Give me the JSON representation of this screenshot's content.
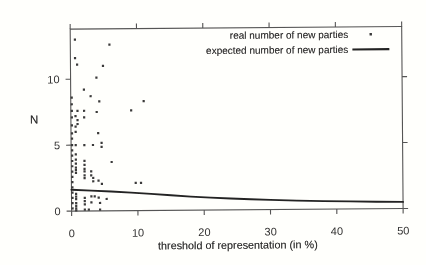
{
  "figure": {
    "background_color": "#fcfbf8",
    "frame_color": "#565656",
    "dot_color": "#3c3c3c",
    "curve_color": "#262626",
    "text_color": "#333333"
  },
  "chart_data": {
    "type": "scatter",
    "xlabel": "threshold of representation (in %)",
    "ylabel": "N",
    "xlim": [
      0,
      50
    ],
    "ylim": [
      0,
      13.8
    ],
    "x_ticks": [
      0,
      10,
      20,
      30,
      40,
      50
    ],
    "y_ticks": [
      0,
      5,
      10
    ],
    "grid": false,
    "legend_position": "top-right-inside",
    "series": [
      {
        "name": "real number of new parties",
        "type": "scatter",
        "marker": "dot",
        "points": [
          [
            0.15,
            8.6
          ],
          [
            0.15,
            8.1
          ],
          [
            0.15,
            7.6
          ],
          [
            0.15,
            7.1
          ],
          [
            0.15,
            6.5
          ],
          [
            0.15,
            5.9
          ],
          [
            0.15,
            5.5
          ],
          [
            0.15,
            5.0
          ],
          [
            0.15,
            4.6
          ],
          [
            0.15,
            4.2
          ],
          [
            0.15,
            3.8
          ],
          [
            0.15,
            3.4
          ],
          [
            0.15,
            3.0
          ],
          [
            0.15,
            2.6
          ],
          [
            0.15,
            2.2
          ],
          [
            0.15,
            1.8
          ],
          [
            0.15,
            1.4
          ],
          [
            0.15,
            1.0
          ],
          [
            0.15,
            0.6
          ],
          [
            0.15,
            0.2
          ],
          [
            0.7,
            13.0
          ],
          [
            0.7,
            11.6
          ],
          [
            0.7,
            7.2
          ],
          [
            0.7,
            6.4
          ],
          [
            0.7,
            6.0
          ],
          [
            0.7,
            5.0
          ],
          [
            0.7,
            4.3
          ],
          [
            0.7,
            3.9
          ],
          [
            0.7,
            3.6
          ],
          [
            0.7,
            3.3
          ],
          [
            0.7,
            3.1
          ],
          [
            0.7,
            2.9
          ],
          [
            0.7,
            1.3
          ],
          [
            0.7,
            1.1
          ],
          [
            0.7,
            0.9
          ],
          [
            0.7,
            0.6
          ],
          [
            0.7,
            0.4
          ],
          [
            0.7,
            0.2
          ],
          [
            0.7,
            0.05
          ],
          [
            1.0,
            11.1
          ],
          [
            1.0,
            7.6
          ],
          [
            1.0,
            6.9
          ],
          [
            1.0,
            6.6
          ],
          [
            2.0,
            9.2
          ],
          [
            2.0,
            7.6
          ],
          [
            2.0,
            7.1
          ],
          [
            2.0,
            5.0
          ],
          [
            2.0,
            3.8
          ],
          [
            2.0,
            3.5
          ],
          [
            2.0,
            3.2
          ],
          [
            2.0,
            3.0
          ],
          [
            2.0,
            2.7
          ],
          [
            2.0,
            2.5
          ],
          [
            2.0,
            1.0
          ],
          [
            2.0,
            0.75
          ],
          [
            2.0,
            0.5
          ],
          [
            2.0,
            0.1
          ],
          [
            2.6,
            0.1
          ],
          [
            3.0,
            8.7
          ],
          [
            3.0,
            3.0
          ],
          [
            3.0,
            2.7
          ],
          [
            3.0,
            1.1
          ],
          [
            3.0,
            0.65
          ],
          [
            3.3,
            5.0
          ],
          [
            3.3,
            2.5
          ],
          [
            3.3,
            2.25
          ],
          [
            3.5,
            1.1
          ],
          [
            3.9,
            10.1
          ],
          [
            3.9,
            7.5
          ],
          [
            4.1,
            5.9
          ],
          [
            4.1,
            2.3
          ],
          [
            4.1,
            1.0
          ],
          [
            4.3,
            8.3
          ],
          [
            4.3,
            0.6
          ],
          [
            4.3,
            0.1
          ],
          [
            4.6,
            5.15
          ],
          [
            4.6,
            4.85
          ],
          [
            4.6,
            2.05
          ],
          [
            4.9,
            11.0
          ],
          [
            5.3,
            0.9
          ],
          [
            5.9,
            12.6
          ],
          [
            6.1,
            3.7
          ],
          [
            9.1,
            7.6
          ],
          [
            9.7,
            2.1
          ],
          [
            10.5,
            2.1
          ],
          [
            11.0,
            8.3
          ]
        ]
      },
      {
        "name": "expected number of new parties",
        "type": "line",
        "points": [
          [
            0,
            1.62
          ],
          [
            3,
            1.54
          ],
          [
            6,
            1.46
          ],
          [
            9,
            1.37
          ],
          [
            12,
            1.26
          ],
          [
            15,
            1.14
          ],
          [
            18,
            1.03
          ],
          [
            21,
            0.94
          ],
          [
            24,
            0.86
          ],
          [
            27,
            0.79
          ],
          [
            30,
            0.73
          ],
          [
            34,
            0.66
          ],
          [
            38,
            0.61
          ],
          [
            42,
            0.57
          ],
          [
            46,
            0.53
          ],
          [
            50,
            0.5
          ]
        ]
      }
    ]
  },
  "legend": {
    "items": [
      {
        "label": "real number of new parties",
        "marker": "dot-marker-icon"
      },
      {
        "label": "expected number of new parties",
        "marker": "line-marker-icon"
      }
    ]
  }
}
